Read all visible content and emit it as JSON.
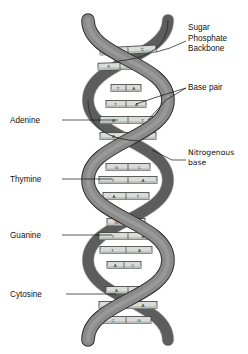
{
  "figure": {
    "background": "#ffffff"
  },
  "colors": {
    "backbone_front": "#8a8a8a",
    "backbone_back": "#6f6f6f",
    "backbone_outline": "#2e2e2e",
    "rung_fill": "#d9dcd9",
    "rung_fill_dark": "#b9bdb9",
    "rung_outline": "#3a3a3a",
    "leader": "#111111",
    "text": "#111111"
  },
  "labels_left": [
    {
      "id": "adenine",
      "text": "Adenine",
      "x": 10,
      "y": 123,
      "leader_x1": 62,
      "leader_y1": 120,
      "leader_x2": 118,
      "leader_y2": 120
    },
    {
      "id": "thymine",
      "text": "Thymine",
      "x": 10,
      "y": 182,
      "leader_x1": 62,
      "leader_y1": 179,
      "leader_x2": 112,
      "leader_y2": 179
    },
    {
      "id": "guanine",
      "text": "Guanine",
      "x": 10,
      "y": 238,
      "leader_x1": 62,
      "leader_y1": 235,
      "leader_x2": 112,
      "leader_y2": 235
    },
    {
      "id": "cytosine",
      "text": "Cytosine",
      "x": 10,
      "y": 297,
      "leader_x1": 66,
      "leader_y1": 294,
      "leader_x2": 116,
      "leader_y2": 294
    }
  ],
  "labels_right": [
    {
      "id": "sugar-phosphate-backbone",
      "lines": [
        "Sugar",
        "Phosphate",
        "Backbone"
      ],
      "x": 188,
      "y": 30,
      "font": "sans"
    },
    {
      "id": "base-pair",
      "lines": [
        "Base pair"
      ],
      "x": 188,
      "y": 90,
      "font": "sans"
    },
    {
      "id": "nitrogenous-base",
      "lines": [
        "Nitrogenous",
        "base"
      ],
      "x": 188,
      "y": 155,
      "font": "alt"
    }
  ],
  "base_pairs": [
    {
      "index": 0,
      "left": "G",
      "right": "C",
      "y": 50,
      "x": 128,
      "width": 56,
      "tilt": -3
    },
    {
      "index": 1,
      "left": "A",
      "right": "T",
      "y": 66,
      "x": 120,
      "width": 44,
      "tilt": -2
    },
    {
      "index": 2,
      "left": "T",
      "right": "A",
      "y": 88,
      "x": 126,
      "width": 30,
      "tilt": 0
    },
    {
      "index": 3,
      "left": "T",
      "right": "A",
      "y": 104,
      "x": 126,
      "width": 40,
      "tilt": 0
    },
    {
      "index": 4,
      "left": "A",
      "right": "T",
      "y": 120,
      "x": 128,
      "width": 56,
      "tilt": 0
    },
    {
      "index": 5,
      "left": "A",
      "right": "T",
      "y": 136,
      "x": 128,
      "width": 56,
      "tilt": 0
    },
    {
      "index": 6,
      "left": "G",
      "right": "C",
      "y": 167,
      "x": 128,
      "width": 44,
      "tilt": 0
    },
    {
      "index": 7,
      "left": "T",
      "right": "A",
      "y": 180,
      "x": 128,
      "width": 58,
      "tilt": 0
    },
    {
      "index": 8,
      "left": "A",
      "right": "T",
      "y": 196,
      "x": 126,
      "width": 46,
      "tilt": 0
    },
    {
      "index": 9,
      "left": "G",
      "right": "C",
      "y": 222,
      "x": 126,
      "width": 38,
      "tilt": 0
    },
    {
      "index": 10,
      "left": "T",
      "right": "A",
      "y": 236,
      "x": 128,
      "width": 58,
      "tilt": 0
    },
    {
      "index": 11,
      "left": "T",
      "right": "A",
      "y": 250,
      "x": 126,
      "width": 52,
      "tilt": 0
    },
    {
      "index": 12,
      "left": "A",
      "right": "C",
      "y": 265,
      "x": 124,
      "width": 34,
      "tilt": 0
    },
    {
      "index": 13,
      "left": "A",
      "right": "T",
      "y": 290,
      "x": 128,
      "width": 44,
      "tilt": 0
    },
    {
      "index": 14,
      "left": "T",
      "right": "A",
      "y": 305,
      "x": 128,
      "width": 58,
      "tilt": 0
    },
    {
      "index": 15,
      "left": "C",
      "right": "G",
      "y": 320,
      "x": 126,
      "width": 50,
      "tilt": 0
    }
  ],
  "helix": {
    "turns": 3,
    "top_y": 18,
    "bottom_y": 344,
    "center_x": 128,
    "amplitude": 40,
    "ribbon_width": 11
  }
}
